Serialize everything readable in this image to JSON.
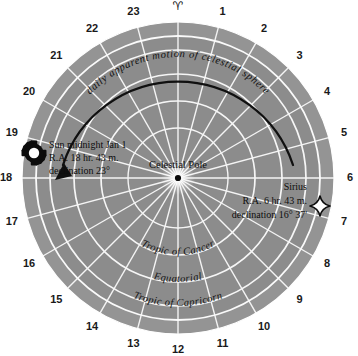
{
  "diagram": {
    "center_label": "Celestial Pole",
    "vernal_equinox_symbol": "♈",
    "hour_numbers": [
      "1",
      "2",
      "3",
      "4",
      "5",
      "6",
      "7",
      "8",
      "9",
      "10",
      "11",
      "12",
      "13",
      "14",
      "15",
      "16",
      "17",
      "18",
      "19",
      "20",
      "21",
      "22",
      "23"
    ],
    "motion_arc_label": "daily apparent motion of celestial sphere",
    "circle_labels": [
      "Tropic of Cancer",
      "Equatorial",
      "Tropic of Capricorn"
    ],
    "objects": [
      {
        "name": "sun",
        "icon": "sun-burst-icon",
        "lines": [
          "Sun midnight Jan 1",
          "R.A. 18 hr. 43 m.",
          "declination 23°"
        ]
      },
      {
        "name": "sirius",
        "icon": "four-point-star-icon",
        "lines": [
          "Sirius",
          "R.A. 6 hr. 43 m.",
          "declination 16° 37'"
        ]
      }
    ],
    "colors": {
      "sky_fill": "#8c8c8c",
      "ring_fill": "#949494",
      "grid_line": "#f2f2f2",
      "arc_stroke": "#0f0f0f",
      "text": "#111111",
      "background": "#ffffff"
    }
  },
  "chart_data": {
    "type": "polar-diagram",
    "center": {
      "cx": 178,
      "cy": 178,
      "label": "Celestial Pole"
    },
    "angular_axis": {
      "label": "Right Ascension (hours)",
      "unit": "hours",
      "range": [
        0,
        24
      ],
      "tick_count": 24,
      "zero_at": "top",
      "direction": "clockwise",
      "ticks": [
        0,
        1,
        2,
        3,
        4,
        5,
        6,
        7,
        8,
        9,
        10,
        11,
        12,
        13,
        14,
        15,
        16,
        17,
        18,
        19,
        20,
        21,
        22,
        23
      ],
      "tick_labels": [
        "♈",
        "1",
        "2",
        "3",
        "4",
        "5",
        "6",
        "7",
        "8",
        "9",
        "10",
        "11",
        "12",
        "13",
        "14",
        "15",
        "16",
        "17",
        "18",
        "19",
        "20",
        "21",
        "22",
        "23"
      ]
    },
    "radial_axis": {
      "label": "Declination",
      "rings": [
        {
          "name": "Tropic of Cancer",
          "radius_px": 77
        },
        {
          "name": "Equatorial",
          "radius_px": 104
        },
        {
          "name": "Tropic of Capricorn",
          "radius_px": 128
        },
        {
          "name": "outer limb",
          "radius_px": 142
        },
        {
          "name": "hour band outer",
          "radius_px": 156
        }
      ]
    },
    "annotations": [
      {
        "text": "daily apparent motion of celestial sphere",
        "kind": "arc-arrow",
        "direction": "counterclockwise"
      }
    ],
    "points": [
      {
        "label": "Sun midnight Jan 1",
        "ra_hours": 18.7167,
        "declination_deg": 23.0,
        "marker": "sun-burst"
      },
      {
        "label": "Sirius",
        "ra_hours": 6.7167,
        "declination_deg": 16.6167,
        "marker": "four-point-star"
      }
    ],
    "grid": true,
    "legend": "none"
  }
}
